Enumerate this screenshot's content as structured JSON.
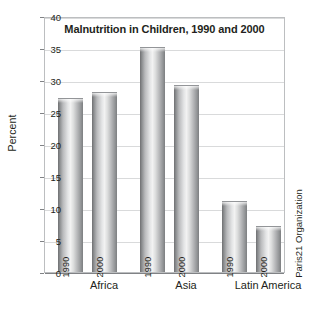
{
  "chart_data": {
    "type": "bar",
    "title": "Malnutrition in Children, 1990 and 2000",
    "xlabel": "",
    "ylabel": "Percent",
    "ylim": [
      0,
      40
    ],
    "yticks": [
      0,
      5,
      10,
      15,
      20,
      25,
      30,
      35,
      40
    ],
    "ytick_labels": [
      "0",
      "5",
      "10",
      "15",
      "20",
      "25",
      "30",
      "35",
      "40"
    ],
    "grid": true,
    "legend": "none",
    "categories": [
      "Africa",
      "Asia",
      "Latin America"
    ],
    "series": [
      {
        "name": "1990",
        "values": [
          27,
          35,
          11
        ]
      },
      {
        "name": "2000",
        "values": [
          28,
          29,
          7
        ]
      }
    ],
    "bars": [
      {
        "category": "Africa",
        "series": "1990",
        "value": 27,
        "label": "1990"
      },
      {
        "category": "Africa",
        "series": "2000",
        "value": 28,
        "label": "2000"
      },
      {
        "category": "Asia",
        "series": "1990",
        "value": 35,
        "label": "1990"
      },
      {
        "category": "Asia",
        "series": "2000",
        "value": 29,
        "label": "2000"
      },
      {
        "category": "Latin America",
        "series": "1990",
        "value": 11,
        "label": "1990"
      },
      {
        "category": "Latin America",
        "series": "2000",
        "value": 7,
        "label": "2000"
      }
    ],
    "annotations": {
      "source": "Paris21 Organization"
    },
    "colors": {
      "bar_light": "#f2f2f2",
      "bar_dark": "#6e6f71",
      "gridline": "#d9dadb",
      "axis": "#808285",
      "frame": "#bcbec0",
      "text": "#231f20",
      "background": "#ffffff"
    }
  }
}
